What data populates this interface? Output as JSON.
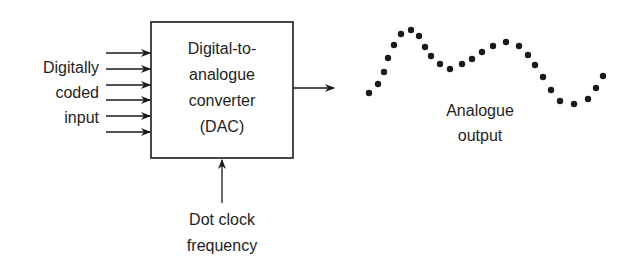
{
  "diagram": {
    "type": "block-diagram",
    "input_label": [
      "Digitally",
      "coded",
      "input"
    ],
    "block_label": [
      "Digital-to-",
      "analogue",
      "converter",
      "(DAC)"
    ],
    "clock_label": [
      "Dot clock",
      "frequency"
    ],
    "output_label": [
      "Analogue",
      "output"
    ],
    "input_line_count": 6,
    "colors": {
      "line": "#1a1a1a",
      "background": "#ffffff"
    },
    "output_dots": [
      [
        369,
        93
      ],
      [
        378,
        84
      ],
      [
        384,
        72
      ],
      [
        388,
        58
      ],
      [
        394,
        45
      ],
      [
        401,
        34
      ],
      [
        411,
        30
      ],
      [
        419,
        36
      ],
      [
        425,
        47
      ],
      [
        431,
        56
      ],
      [
        440,
        64
      ],
      [
        450,
        69
      ],
      [
        462,
        64
      ],
      [
        472,
        59
      ],
      [
        482,
        52
      ],
      [
        493,
        46
      ],
      [
        506,
        42
      ],
      [
        519,
        46
      ],
      [
        528,
        55
      ],
      [
        535,
        65
      ],
      [
        543,
        77
      ],
      [
        551,
        90
      ],
      [
        560,
        101
      ],
      [
        574,
        104
      ],
      [
        588,
        99
      ],
      [
        596,
        88
      ],
      [
        603,
        76
      ]
    ]
  }
}
